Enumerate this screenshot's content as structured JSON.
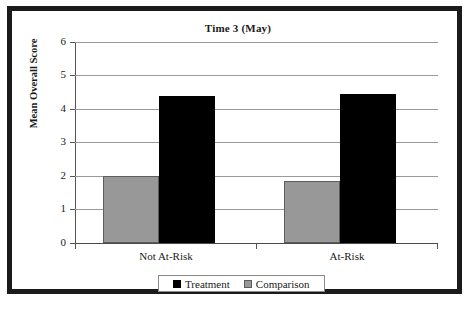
{
  "chart_data": {
    "type": "bar",
    "title": "Time 3 (May)",
    "xlabel": "",
    "ylabel": "Mean Overall Score",
    "ylim": [
      0,
      6
    ],
    "ytick_labels": [
      "6",
      "5",
      "4",
      "3",
      "2",
      "1",
      "0"
    ],
    "ytick_values": [
      6,
      5,
      4,
      3,
      2,
      1,
      0
    ],
    "grid": true,
    "legend_position": "bottom",
    "categories": [
      "Not At-Risk",
      "At-Risk"
    ],
    "series": [
      {
        "name": "Treatment",
        "color": "#000000",
        "values": [
          4.4,
          4.45
        ]
      },
      {
        "name": "Comparison",
        "color": "#989898",
        "values": [
          2.0,
          1.85
        ]
      }
    ]
  }
}
